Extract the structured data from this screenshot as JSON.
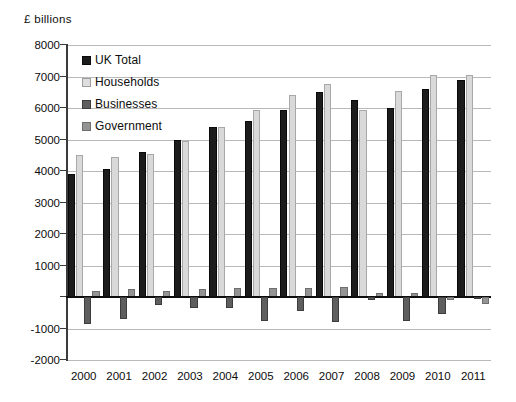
{
  "chart_data": {
    "type": "bar",
    "title": "£ billions",
    "xlabel": "",
    "ylabel": "£ billions",
    "categories": [
      "2000",
      "2001",
      "2002",
      "2003",
      "2004",
      "2005",
      "2006",
      "2007",
      "2008",
      "2009",
      "2010",
      "2011"
    ],
    "series": [
      {
        "name": "UK Total",
        "color": "#1c1c1c",
        "values": [
          3900,
          4050,
          4600,
          5000,
          5400,
          5600,
          5950,
          6500,
          6250,
          6000,
          6600,
          6900
        ]
      },
      {
        "name": "Households",
        "color": "#d9d9d9",
        "values": [
          4500,
          4450,
          4550,
          4950,
          5400,
          5950,
          6400,
          6750,
          5950,
          6550,
          7050,
          7050
        ]
      },
      {
        "name": "Businesses",
        "color": "#5e5e5e",
        "values": [
          -850,
          -700,
          -250,
          -350,
          -350,
          -750,
          -450,
          -800,
          -100,
          -750,
          -550,
          -30
        ]
      },
      {
        "name": "Government",
        "color": "#949494",
        "values": [
          180,
          250,
          200,
          250,
          300,
          280,
          300,
          320,
          130,
          120,
          -100,
          -230
        ]
      }
    ],
    "ylim": [
      -2000,
      8000
    ],
    "ytick_values": [
      8000,
      7000,
      6000,
      5000,
      4000,
      3000,
      2000,
      1000,
      0,
      -1000,
      -2000
    ],
    "ytick_labels": [
      "8000",
      "7000",
      "6000",
      "5000",
      "4000",
      "3000",
      "2000",
      "1000",
      "",
      "-1000",
      "-2000"
    ],
    "grid": true,
    "legend_position": "top-left"
  }
}
